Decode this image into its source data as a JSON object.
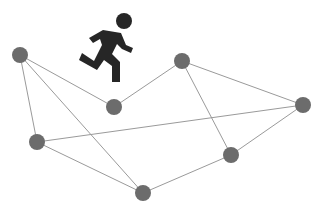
{
  "diagram": {
    "type": "network-graph",
    "icon": {
      "name": "running-person-icon",
      "color": "#262626"
    },
    "node_color": "#6c6c6c",
    "edge_color": "#9a9a9a",
    "nodes": [
      {
        "id": "A",
        "x": 20,
        "y": 55
      },
      {
        "id": "B",
        "x": 114,
        "y": 107
      },
      {
        "id": "C",
        "x": 182,
        "y": 61
      },
      {
        "id": "D",
        "x": 303,
        "y": 105
      },
      {
        "id": "E",
        "x": 37,
        "y": 142
      },
      {
        "id": "F",
        "x": 231,
        "y": 155
      },
      {
        "id": "G",
        "x": 143,
        "y": 193
      }
    ],
    "edges": [
      [
        "A",
        "B"
      ],
      [
        "A",
        "E"
      ],
      [
        "A",
        "G"
      ],
      [
        "B",
        "C"
      ],
      [
        "C",
        "D"
      ],
      [
        "C",
        "F"
      ],
      [
        "E",
        "D"
      ],
      [
        "E",
        "G"
      ],
      [
        "G",
        "F"
      ],
      [
        "F",
        "D"
      ]
    ]
  }
}
